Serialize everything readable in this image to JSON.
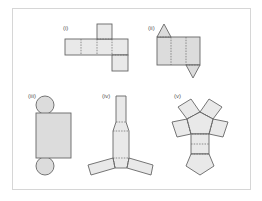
{
  "figure": {
    "nets": [
      {
        "label": "(i)",
        "solid": "cube",
        "fill": "#ececec"
      },
      {
        "label": "(ii)",
        "solid": "triangular prism",
        "fill": "#dedede"
      },
      {
        "label": "(iii)",
        "solid": "cylinder",
        "fill": "#dcdcdc"
      },
      {
        "label": "(iv)",
        "solid": "triangular frustum",
        "fill": "#e3e3e3"
      },
      {
        "label": "(v)",
        "solid": "pentagonal prism",
        "fill": "#f1f1f1"
      }
    ],
    "colors": {
      "stroke": "#666666",
      "frame": "#d6d6d6"
    }
  }
}
